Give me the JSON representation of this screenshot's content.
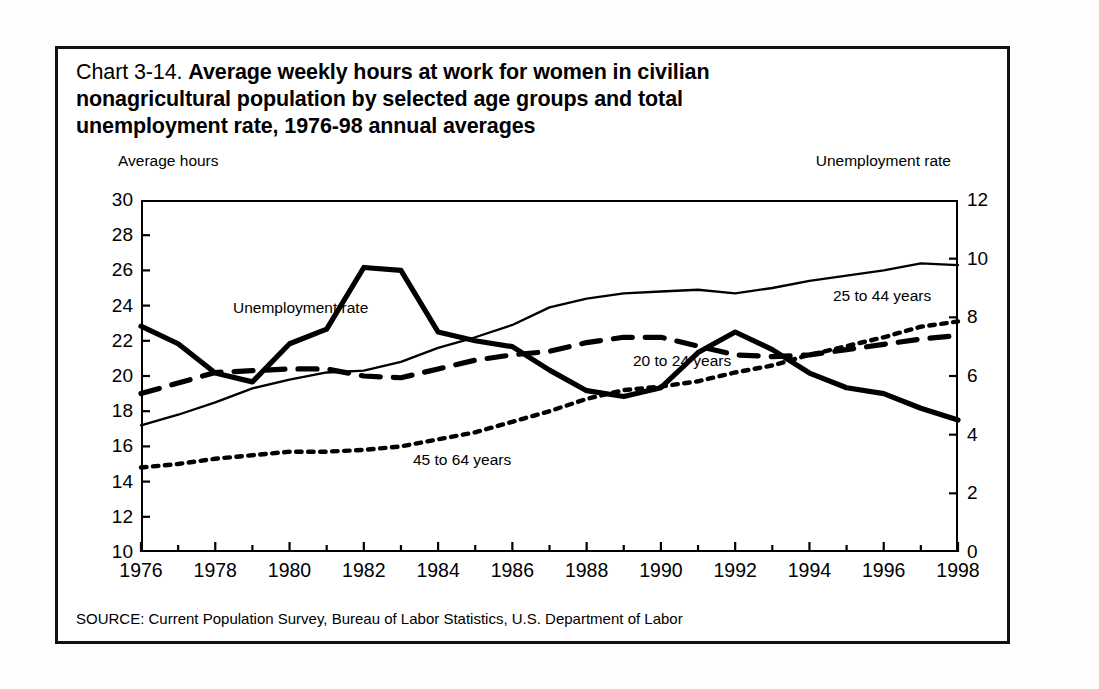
{
  "figure": {
    "chart_number": "Chart 3-14.",
    "title_line1_bold": "Average weekly hours at work for women in civilian",
    "title_line2": "nonagricultural population by selected age groups and total",
    "title_line3": "unemployment rate, 1976-98 annual averages",
    "left_axis_label": "Average hours",
    "right_axis_label": "Unemployment rate",
    "source": "SOURCE: Current Population Survey, Bureau of Labor Statistics, U.S. Department of Labor",
    "line_color": "#000000",
    "frame_color": "#111111",
    "background": "#ffffff"
  },
  "chart_data": {
    "type": "line",
    "title": "Chart 3-14. Average weekly hours at work for women in civilian nonagricultural population by selected age groups and total unemployment rate, 1976-98 annual averages",
    "xlabel": "",
    "ylabel": "Average hours",
    "y2label": "Unemployment rate",
    "xlim": [
      1976,
      1998
    ],
    "ylim": [
      10,
      30
    ],
    "y2lim": [
      0,
      12
    ],
    "yticks": [
      10,
      12,
      14,
      16,
      18,
      20,
      22,
      24,
      26,
      28,
      30
    ],
    "y2ticks": [
      0,
      2,
      4,
      6,
      8,
      10,
      12
    ],
    "xticks": [
      1976,
      1978,
      1980,
      1982,
      1984,
      1986,
      1988,
      1990,
      1992,
      1994,
      1996,
      1998
    ],
    "minor_xticks": "annual",
    "grid": false,
    "legend_position": "inline-annotations",
    "x": [
      1976,
      1977,
      1978,
      1979,
      1980,
      1981,
      1982,
      1983,
      1984,
      1985,
      1986,
      1987,
      1988,
      1989,
      1990,
      1991,
      1992,
      1993,
      1994,
      1995,
      1996,
      1997,
      1998
    ],
    "series": [
      {
        "name": "25 to 44 years",
        "axis": "left",
        "style": "thin-solid",
        "units": "average weekly hours",
        "values": [
          17.2,
          17.8,
          18.5,
          19.3,
          19.8,
          20.2,
          20.3,
          20.8,
          21.6,
          22.2,
          22.9,
          23.9,
          24.4,
          24.7,
          24.8,
          24.9,
          24.7,
          25.0,
          25.4,
          25.7,
          26.0,
          26.4,
          26.3
        ]
      },
      {
        "name": "20 to 24 years",
        "axis": "left",
        "style": "thick-dashed",
        "units": "average weekly hours",
        "values": [
          19.0,
          19.6,
          20.2,
          20.3,
          20.4,
          20.4,
          20.0,
          19.9,
          20.4,
          20.9,
          21.2,
          21.4,
          21.9,
          22.2,
          22.2,
          21.7,
          21.2,
          21.1,
          21.2,
          21.5,
          21.8,
          22.1,
          22.3
        ]
      },
      {
        "name": "45 to 64 years",
        "axis": "left",
        "style": "dotted",
        "units": "average weekly hours",
        "values": [
          14.8,
          15.0,
          15.3,
          15.5,
          15.7,
          15.7,
          15.8,
          16.0,
          16.4,
          16.8,
          17.4,
          18.0,
          18.7,
          19.2,
          19.4,
          19.7,
          20.2,
          20.6,
          21.2,
          21.7,
          22.2,
          22.8,
          23.1
        ]
      },
      {
        "name": "Unemployment rate",
        "axis": "right",
        "style": "thick-solid",
        "units": "percent",
        "values": [
          7.7,
          7.1,
          6.1,
          5.8,
          7.1,
          7.6,
          9.7,
          9.6,
          7.5,
          7.2,
          7.0,
          6.2,
          5.5,
          5.3,
          5.6,
          6.8,
          7.5,
          6.9,
          6.1,
          5.6,
          5.4,
          4.9,
          4.5
        ]
      }
    ],
    "annotations": [
      {
        "text": "Unemployment rate",
        "x_px": 175,
        "y_px": 250
      },
      {
        "text": "25 to 44 years",
        "x_px": 775,
        "y_px": 238
      },
      {
        "text": "20 to 24 years",
        "x_px": 575,
        "y_px": 303
      },
      {
        "text": "45 to 64 years",
        "x_px": 355,
        "y_px": 402
      }
    ]
  }
}
